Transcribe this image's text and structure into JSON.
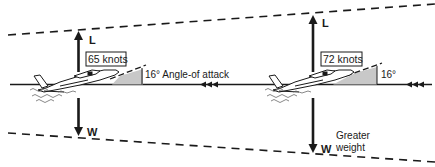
{
  "diagram": {
    "left": {
      "lift_label": "L",
      "weight_label": "W",
      "speed_label": "65 knots",
      "aoa_label": "16° Angle-of attack"
    },
    "right": {
      "lift_label": "L",
      "weight_label": "W",
      "speed_label": "72 knots",
      "aoa_label": "16°",
      "weight_note_line1": "Greater",
      "weight_note_line2": "weight"
    },
    "colors": {
      "line": "#1a1a1a",
      "aoa_fill": "#c8c8c8",
      "background": "#ffffff"
    }
  }
}
